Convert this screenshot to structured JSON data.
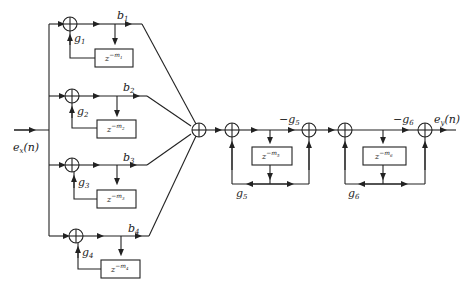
{
  "diagram": {
    "type": "block-diagram",
    "input_label": "e_x(n)",
    "output_label": "e_y(n)",
    "comb_filters": [
      {
        "gain_label": "g1",
        "output_gain_label": "b1",
        "delay_label": "z^-m1"
      },
      {
        "gain_label": "g2",
        "output_gain_label": "b2",
        "delay_label": "z^-m2"
      },
      {
        "gain_label": "g3",
        "output_gain_label": "b3",
        "delay_label": "z^-m3"
      },
      {
        "gain_label": "g4",
        "output_gain_label": "b4",
        "delay_label": "z^-m4"
      }
    ],
    "allpass_filters": [
      {
        "feedforward_label": "-g5",
        "feedback_label": "g5",
        "delay_label": "z^-m5"
      },
      {
        "feedforward_label": "-g6",
        "feedback_label": "g6",
        "delay_label": "z^-m6"
      }
    ],
    "text": {
      "in_e": "e",
      "in_sub": "x",
      "in_n": "(n)",
      "out_e": "e",
      "out_sub": "y",
      "out_n": "(n)",
      "g": "g",
      "b": "b",
      "z": "z",
      "m": "m",
      "minus": "−",
      "idx": [
        "1",
        "2",
        "3",
        "4",
        "5",
        "6"
      ]
    }
  }
}
